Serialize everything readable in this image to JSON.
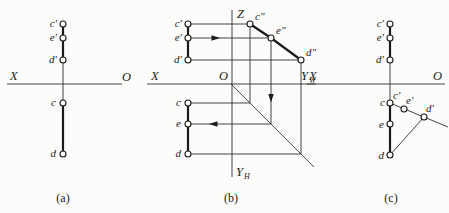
{
  "colors": {
    "ink": "#1b1b19",
    "background": "#fcfcfa"
  },
  "panel_a": {
    "caption": "(a)",
    "axis": {
      "x": "X",
      "o": "O"
    },
    "labels": {
      "c_prime": "c′",
      "e_prime": "e′",
      "d_prime": "d′",
      "c": "c",
      "d": "d"
    }
  },
  "panel_b": {
    "caption": "(b)",
    "axis": {
      "x": "X",
      "o": "O",
      "z": "Z",
      "yw_main": "Y",
      "yw_sub": "W",
      "yh_main": "Y",
      "yh_sub": "H"
    },
    "labels": {
      "c_prime": "c′",
      "e_prime": "e′",
      "d_prime": "d′",
      "c": "c",
      "e": "e",
      "d": "d",
      "c_dblprime": "c″",
      "e_dblprime": "e″",
      "d_dblprime": "d″"
    }
  },
  "panel_c": {
    "caption": "(c)",
    "axis": {
      "x": "X",
      "o": "O"
    },
    "labels": {
      "c_prime": "c′",
      "e_prime": "e′",
      "d_prime": "d′",
      "c": "c",
      "e": "e",
      "d": "d",
      "c1_prime": "c′",
      "e1_prime": "e′",
      "d1_prime": "d′"
    }
  }
}
